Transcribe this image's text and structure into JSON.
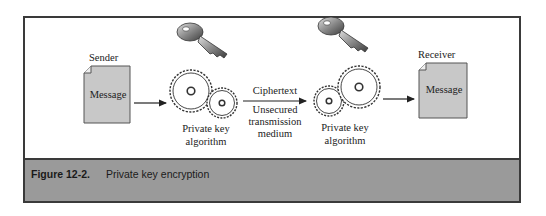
{
  "diagram": {
    "sender": {
      "role_label": "Sender",
      "document_label": "Message"
    },
    "receiver": {
      "role_label": "Receiver",
      "document_label": "Message"
    },
    "encrypt": {
      "label_line1": "Private key",
      "label_line2": "algorithm",
      "key_icon": "key-icon",
      "gears_icon": "gears-icon"
    },
    "decrypt": {
      "label_line1": "Private key",
      "label_line2": "algorithm",
      "key_icon": "key-icon",
      "gears_icon": "gears-icon"
    },
    "channel": {
      "above_arrow": "Ciphertext",
      "below_line1": "Unsecured",
      "below_line2": "transmission",
      "below_line3": "medium"
    }
  },
  "caption": {
    "figure_number": "Figure 12-2.",
    "title": "Private key encryption"
  },
  "colors": {
    "frame_border": "#3a3a3a",
    "caption_bg": "#9a9a9a",
    "document_fill": "#c8c8c8",
    "key_fill": "#7a7a7a"
  }
}
